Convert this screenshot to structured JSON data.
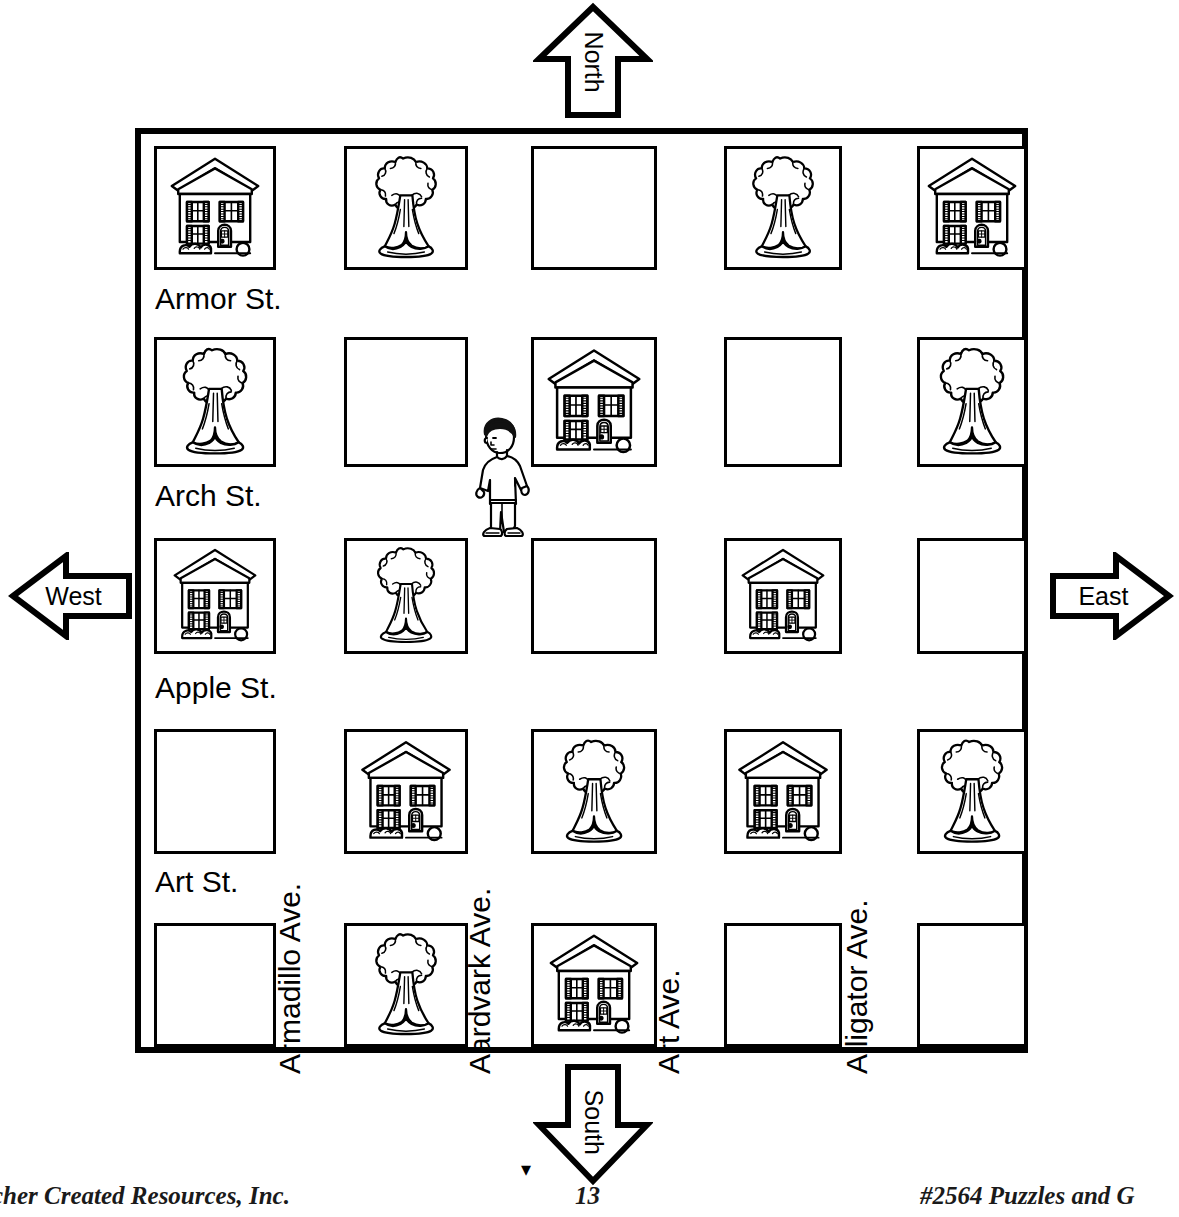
{
  "page": {
    "background_color": "#ffffff",
    "ink_color": "#000000"
  },
  "compass": {
    "north": {
      "label": "North",
      "direction": "up",
      "icon": "arrow-up-icon"
    },
    "south": {
      "label": "South",
      "direction": "down",
      "icon": "arrow-down-icon"
    },
    "west": {
      "label": "West",
      "direction": "left",
      "icon": "arrow-left-icon"
    },
    "east": {
      "label": "East",
      "direction": "right",
      "icon": "arrow-right-icon"
    }
  },
  "map": {
    "streets": [
      {
        "name": "Armor St.",
        "orientation": "horizontal",
        "index": 0
      },
      {
        "name": "Arch St.",
        "orientation": "horizontal",
        "index": 1
      },
      {
        "name": "Apple St.",
        "orientation": "horizontal",
        "index": 2
      },
      {
        "name": "Art St.",
        "orientation": "horizontal",
        "index": 3
      }
    ],
    "avenues": [
      {
        "name": "Armadillo Ave.",
        "orientation": "vertical",
        "index": 0
      },
      {
        "name": "Aardvark Ave.",
        "orientation": "vertical",
        "index": 1
      },
      {
        "name": "Art Ave.",
        "orientation": "vertical",
        "index": 2
      },
      {
        "name": "Alligator Ave.",
        "orientation": "vertical",
        "index": 3
      }
    ],
    "grid": {
      "rows": 5,
      "columns": 5,
      "blocks": [
        [
          "house",
          "tree",
          "empty",
          "tree",
          "house"
        ],
        [
          "tree",
          "empty",
          "house",
          "empty",
          "tree"
        ],
        [
          "house",
          "tree",
          "empty",
          "house",
          "empty"
        ],
        [
          "empty",
          "house",
          "tree",
          "house",
          "tree"
        ],
        [
          "empty",
          "tree",
          "house",
          "empty",
          "empty"
        ]
      ]
    },
    "person": {
      "icon": "walking-boy-icon",
      "description": "boy walking",
      "location": "corner of Arch St. and Aardvark Ave."
    }
  },
  "footer": {
    "left": "cher Created Resources, Inc.",
    "page_number": "13",
    "right": "#2564 Puzzles and G"
  }
}
